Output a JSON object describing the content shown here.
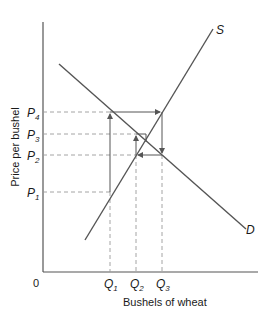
{
  "diagram": {
    "x_axis_label": "Bushels of wheat",
    "y_axis_label": "Price per bushel",
    "origin_label": "0",
    "supply_label": "S",
    "demand_label": "D",
    "price_labels": [
      {
        "main": "P",
        "sub": "4",
        "y": 112
      },
      {
        "main": "P",
        "sub": "3",
        "y": 134
      },
      {
        "main": "P",
        "sub": "2",
        "y": 155
      },
      {
        "main": "P",
        "sub": "1",
        "y": 192
      }
    ],
    "quantity_labels": [
      {
        "main": "Q",
        "sub": "1",
        "x": 110
      },
      {
        "main": "Q",
        "sub": "2",
        "x": 136
      },
      {
        "main": "Q",
        "sub": "3",
        "x": 162
      }
    ],
    "colors": {
      "line": "#555555",
      "dashed": "#9a9a9a",
      "text": "#1a1a1a"
    }
  }
}
